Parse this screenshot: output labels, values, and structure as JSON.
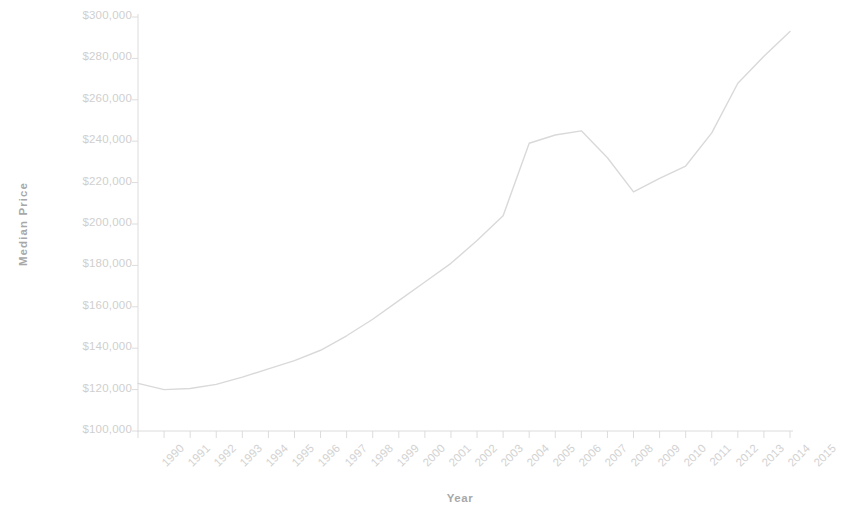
{
  "chart_data": {
    "type": "line",
    "title": "",
    "xlabel": "Year",
    "ylabel": "Median Price",
    "categories": [
      "1990",
      "1991",
      "1992",
      "1993",
      "1994",
      "1995",
      "1996",
      "1997",
      "1998",
      "1999",
      "2000",
      "2001",
      "2002",
      "2003",
      "2004",
      "2005",
      "2006",
      "2007",
      "2008",
      "2009",
      "2010",
      "2011",
      "2012",
      "2013",
      "2014",
      "2015"
    ],
    "values": [
      123000,
      120000,
      120500,
      122500,
      126000,
      130000,
      134000,
      139000,
      146000,
      154000,
      163000,
      172000,
      181000,
      192000,
      204000,
      239000,
      243000,
      245000,
      232000,
      215500,
      222000,
      228000,
      244000,
      268000,
      281000,
      293000
    ],
    "series": [
      {
        "name": "Median Price",
        "values": [
          123000,
          120000,
          120500,
          122500,
          126000,
          130000,
          134000,
          139000,
          146000,
          154000,
          163000,
          172000,
          181000,
          192000,
          204000,
          239000,
          243000,
          245000,
          232000,
          215500,
          222000,
          228000,
          244000,
          268000,
          281000,
          293000
        ]
      }
    ],
    "ylim": [
      100000,
      300000
    ],
    "ytick_step": 20000,
    "ytick_labels": [
      "$300,000",
      "$280,000",
      "$260,000",
      "$240,000",
      "$220,000",
      "$200,000",
      "$180,000",
      "$160,000",
      "$140,000",
      "$120,000",
      "$100,000"
    ],
    "grid": false,
    "legend": "none",
    "line_color": "#d9d9d9",
    "axis_color": "#dcdcdc",
    "label_color": "#d0d0d0",
    "title_color": "#a8a8a8"
  }
}
